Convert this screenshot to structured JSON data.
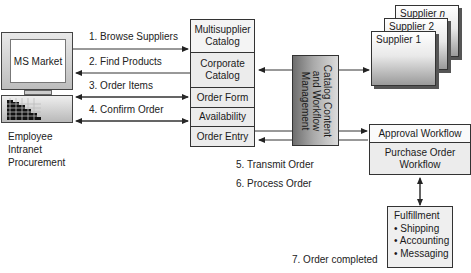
{
  "employee": {
    "screen_label": "MS Market",
    "caption_lines": [
      "Employee",
      "Intranet",
      "Procurement"
    ]
  },
  "steps": [
    {
      "label": "1. Browse Suppliers"
    },
    {
      "label": "2. Find Products"
    },
    {
      "label": "3. Order Items"
    },
    {
      "label": "4. Confirm Order"
    },
    {
      "label": "5. Transmit Order"
    },
    {
      "label": "6. Process Order"
    },
    {
      "label": "7. Order completed"
    }
  ],
  "catalog_stack": {
    "cells": [
      {
        "label_lines": [
          "Multisupplier",
          "Catalog"
        ]
      },
      {
        "label_lines": [
          "Corporate",
          "Catalog"
        ]
      },
      {
        "label_lines": [
          "Order Form"
        ]
      },
      {
        "label_lines": [
          "Availability"
        ]
      },
      {
        "label_lines": [
          "Order Entry"
        ]
      }
    ]
  },
  "management": {
    "label_lines": [
      "Catalog Content",
      "and Workflow",
      "Management"
    ]
  },
  "suppliers": [
    {
      "label": "Supplier ",
      "suffix": "n"
    },
    {
      "label": "Supplier 2",
      "suffix": ""
    },
    {
      "label": "Supplier 1",
      "suffix": ""
    }
  ],
  "workflow": {
    "approval": "Approval Workflow",
    "purchase_lines": [
      "Purchase Order",
      "Workflow"
    ]
  },
  "fulfillment": {
    "title": "Fulfillment",
    "items": [
      "• Shipping",
      "• Accounting",
      "• Messaging"
    ]
  },
  "colors": {
    "line": "#333333",
    "cell_fill": "#ececec",
    "management_dark": "#6e6e6e",
    "management_light": "#d8d8d8"
  }
}
